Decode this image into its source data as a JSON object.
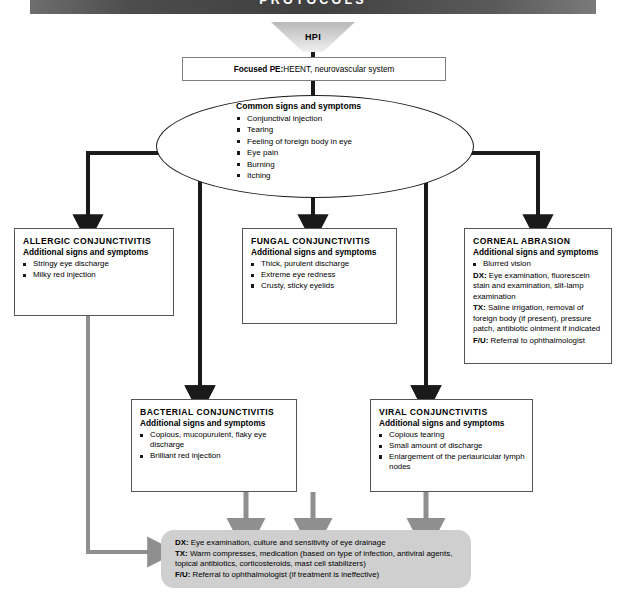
{
  "header": {
    "title": "PROTOCOLS"
  },
  "funnel": {
    "label": "HPI"
  },
  "focused_pe": {
    "label": "Focused PE:",
    "text": " HEENT, neurovascular system"
  },
  "common": {
    "title": "Common signs and symptoms",
    "items": [
      "Conjunctival injection",
      "Tearing",
      "Feeling of foreign body in eye",
      "Eye pain",
      "Burning",
      "Itching"
    ]
  },
  "subheading": "Additional signs and symptoms",
  "boxes": {
    "allergic": {
      "title": "ALLERGIC CONJUNCTIVITIS",
      "sub": "Additional signs and symptoms",
      "items": [
        "Stringy eye discharge",
        "Milky red injection"
      ]
    },
    "fungal": {
      "title": "FUNGAL CONJUNCTIVITIS",
      "sub": "Additional signs and symptoms",
      "items": [
        "Thick, purulent discharge",
        "Extreme eye redness",
        "Crusty, sticky eyelids"
      ]
    },
    "corneal": {
      "title": "CORNEAL ABRASION",
      "sub": "Additional signs and symptoms",
      "items": [
        "Blurred vision"
      ],
      "dx_label": "DX:",
      "dx_text": " Eye examination, fluorescein stain and examination, slit-lamp examination",
      "tx_label": "TX:",
      "tx_text": " Saline irrigation, removal of foreign body (if present), pressure patch, antibiotic ointment if indicated",
      "fu_label": "F/U:",
      "fu_text": " Referral to ophthalmologist"
    },
    "bacterial": {
      "title": "BACTERIAL CONJUNCTIVITIS",
      "sub": "Additional signs and symptoms",
      "items": [
        "Copious, mucopurulent, flaky eye discharge",
        "Brilliant red injection"
      ]
    },
    "viral": {
      "title": "VIRAL CONJUNCTIVITIS",
      "sub": "Additional signs and symptoms",
      "items": [
        "Copious tearing",
        "Small amount of discharge",
        "Enlargement of the periauricular lymph nodes"
      ]
    }
  },
  "outcome": {
    "dx_label": "DX:",
    "dx_text": " Eye examination, culture and sensitivity of eye drainage",
    "tx_label": "TX:",
    "tx_text": " Warm compresses, medication (based on type of infection, antiviral agents, topical antibiotics, corticosteroids, mast cell stabilizers)",
    "fu_label": "F/U:",
    "fu_text": " Referral to ophthalmologist (if treatment is ineffective)"
  },
  "colors": {
    "black_connector": "#1a1a1a",
    "gray_connector": "#8f8f8f",
    "box_border": "#555555",
    "outcome_fill": "#cfcfcf",
    "header_band": "#444444"
  }
}
